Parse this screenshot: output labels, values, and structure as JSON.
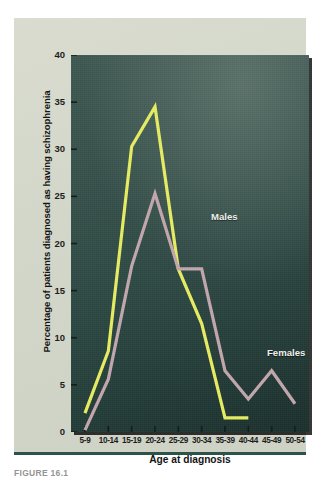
{
  "figure": {
    "caption": "FIGURE 16.1"
  },
  "chart_data": {
    "type": "line",
    "title": "",
    "xlabel": "Age at diagnosis",
    "ylabel": "Percentage of patients diagnosed as having schizophrenia",
    "categories": [
      "5-9",
      "10-14",
      "15-19",
      "20-24",
      "25-29",
      "30-34",
      "35-39",
      "40-44",
      "45-49",
      "50-54"
    ],
    "ylim": [
      0,
      40
    ],
    "yticks": [
      0,
      5,
      10,
      15,
      20,
      25,
      30,
      35,
      40
    ],
    "ytick_labels": [
      "0",
      "5",
      "10",
      "15",
      "20",
      "25",
      "30",
      "35",
      "40"
    ],
    "grid": false,
    "legend": "inline-labels",
    "series": [
      {
        "name": "Males",
        "color": "#e8ef62",
        "values": [
          2.0,
          8.6,
          30.3,
          34.5,
          17.3,
          11.5,
          1.5,
          1.5,
          null,
          null
        ]
      },
      {
        "name": "Females",
        "color": "#c3a8ae",
        "values": [
          0.2,
          5.6,
          17.6,
          25.3,
          17.3,
          17.3,
          6.5,
          3.5,
          6.5,
          3.0
        ]
      }
    ],
    "annotations": [
      {
        "text": "Males",
        "series": "Males"
      },
      {
        "text": "Females",
        "series": "Females"
      }
    ]
  },
  "colors": {
    "males_line": "#e8ef62",
    "females_line": "#c3a8ae",
    "panel_dark": "#2b4641",
    "plate_background": "#d5d9cb",
    "rule": "#2c5348",
    "label_text": "#f2f2ee"
  }
}
